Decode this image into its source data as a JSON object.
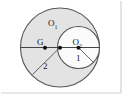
{
  "figure": {
    "type": "geometry-diagram",
    "canvas": {
      "width": 125,
      "height": 97,
      "background": "#ffffff"
    },
    "colors": {
      "stroke": "#555555",
      "large_circle_fill": "#e3e3e3",
      "small_circle_fill": "#ffffff",
      "point_fill": "#111111",
      "label_color": "#1a1a1a",
      "border": "#cfcfcf"
    },
    "shapes": {
      "large_circle": {
        "cx": 60,
        "cy": 47.5,
        "r": 39.5,
        "filled": true
      },
      "small_circle": {
        "cx": 78.5,
        "cy": 47.5,
        "r": 21.0,
        "filled": false
      },
      "diameter_line": {
        "x1": 20.5,
        "y1": 47.5,
        "x2": 99.5,
        "y2": 47.5
      },
      "radius_line_2": {
        "x1": 60,
        "y1": 47.5,
        "x2": 32,
        "y2": 75
      },
      "radius_line_1": {
        "x1": 78.5,
        "y1": 47.5,
        "x2": 93,
        "y2": 62
      }
    },
    "points": [
      {
        "name": "G",
        "cx": 45,
        "cy": 48,
        "r": 1.9
      },
      {
        "name": "tangent-center",
        "cx": 60,
        "cy": 48,
        "r": 1.9
      },
      {
        "name": "O2",
        "cx": 78.5,
        "cy": 48,
        "r": 1.9
      }
    ],
    "labels": {
      "o1_base": "O",
      "o1_sub": "1",
      "o1_x": 50,
      "o1_y": 26,
      "o2_base": "O",
      "o2_sub": "2",
      "o2_x": 74,
      "o2_y": 45,
      "g": "G",
      "g_x": 38,
      "g_y": 45,
      "radius_two": "2",
      "radius_two_x": 45,
      "radius_two_y": 69,
      "radius_one": "1",
      "radius_one_x": 78,
      "radius_one_y": 60
    }
  }
}
